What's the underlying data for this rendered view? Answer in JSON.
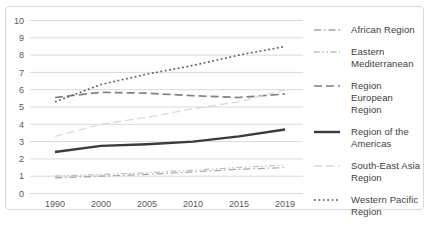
{
  "chart": {
    "background_color": "#ffffff",
    "frame_border_color": "#D9D9D9",
    "gridline_color": "#D9D9D9",
    "axis_tick_color": "#595959",
    "legend_text_color": "#404040",
    "y_tick_labels": [
      "0",
      "1",
      "2",
      "3",
      "4",
      "5",
      "6",
      "7",
      "8",
      "9",
      "10"
    ],
    "x_tick_labels": [
      "1990",
      "2000",
      "2005",
      "2010",
      "2015",
      "2019"
    ]
  },
  "chart_data": {
    "type": "line",
    "title": "",
    "xlabel": "",
    "ylabel": "",
    "ylim": [
      0,
      10
    ],
    "grid": true,
    "legend_position": "right",
    "categories": [
      "1990",
      "2000",
      "2005",
      "2010",
      "2015",
      "2019"
    ],
    "series": [
      {
        "name": "African Region",
        "legend_lines": [
          "African Region"
        ],
        "values": [
          0.9,
          1.0,
          1.1,
          1.25,
          1.4,
          1.5
        ],
        "color": "#A5A5A5",
        "dash": "7 3 1.5 3",
        "width": 1.2
      },
      {
        "name": "Eastern Mediterranean Region",
        "legend_lines": [
          "Eastern",
          "Mediterranean"
        ],
        "values": [
          1.0,
          1.1,
          1.2,
          1.35,
          1.5,
          1.65
        ],
        "color": "#BFBFBF",
        "dash": "6 2.5 1.5 2.5 1.5 2.5",
        "width": 1.2
      },
      {
        "name": "European Region",
        "legend_lines": [
          "Region",
          "European Region"
        ],
        "values": [
          5.55,
          5.85,
          5.8,
          5.65,
          5.55,
          5.75
        ],
        "color": "#7F7F7F",
        "dash": "8 4",
        "width": 1.7
      },
      {
        "name": "Region of the Americas",
        "legend_lines": [
          "Region of the",
          "Americas"
        ],
        "values": [
          2.4,
          2.75,
          2.85,
          3.0,
          3.3,
          3.7
        ],
        "color": "#3B3B3B",
        "dash": "",
        "width": 2.4
      },
      {
        "name": "South-East Asia Region",
        "legend_lines": [
          "South-East Asia",
          "Region"
        ],
        "values": [
          3.3,
          4.0,
          4.4,
          4.9,
          5.3,
          6.0
        ],
        "color": "#D9D9D9",
        "dash": "8 4",
        "width": 1.3
      },
      {
        "name": "Western Pacific Region",
        "legend_lines": [
          "Western Pacific",
          "Region"
        ],
        "values": [
          5.3,
          6.3,
          6.9,
          7.4,
          8.0,
          8.5
        ],
        "color": "#595959",
        "dash": "1.8 2.6",
        "width": 1.6
      }
    ]
  }
}
